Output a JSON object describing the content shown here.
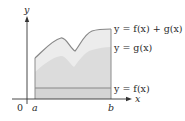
{
  "diagram": {
    "axes": {
      "x_label": "x",
      "y_label": "y",
      "origin_label": "0"
    },
    "interval": {
      "a_label": "a",
      "b_label": "b"
    },
    "curves": {
      "sum": {
        "label": "y = f(x) + g(x)"
      },
      "g": {
        "label": "y = g(x)"
      },
      "f": {
        "label": "y = f(x)"
      }
    },
    "colors": {
      "sum_region": "#eaeaea",
      "g_region": "#d9d9d9",
      "f_region": "#d0d0d0",
      "curve_stroke": "#8c8c8c",
      "axis": "#333333"
    }
  }
}
